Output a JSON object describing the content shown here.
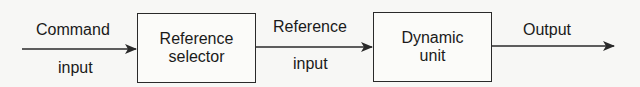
{
  "diagram": {
    "type": "block-diagram",
    "stroke_color": "#2a2a2a",
    "text_color": "#1a1a1a",
    "background": "#f7f7f5",
    "blocks": [
      {
        "id": "reference-selector",
        "line1": "Reference",
        "line2": "selector"
      },
      {
        "id": "dynamic-unit",
        "line1": "Dynamic",
        "line2": "unit"
      }
    ],
    "signals": [
      {
        "id": "command-input",
        "above": "Command",
        "below": "input",
        "from": null,
        "to": "reference-selector"
      },
      {
        "id": "reference-input",
        "above": "Reference",
        "below": "input",
        "from": "reference-selector",
        "to": "dynamic-unit"
      },
      {
        "id": "output",
        "above": "Output",
        "below": "",
        "from": "dynamic-unit",
        "to": null
      }
    ]
  }
}
